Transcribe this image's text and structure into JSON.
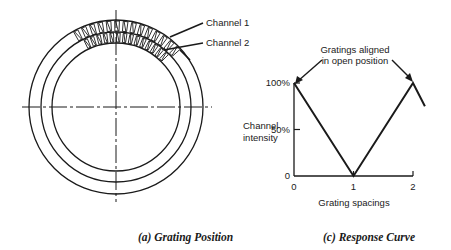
{
  "grating_diagram": {
    "labels": {
      "channel_1": "Channel 1",
      "channel_2": "Channel 2"
    },
    "caption": "(a)  Grating Position"
  },
  "response_chart": {
    "caption": "(c)  Response Curve",
    "annotation": [
      "Gratings aligned",
      "in open position"
    ]
  },
  "chart_data": {
    "type": "line",
    "title": "Response Curve",
    "xlabel": "Grating spacings",
    "ylabel": "Channel intensity",
    "ylabel_lines": [
      "Channel",
      "intensity"
    ],
    "x": [
      0,
      1,
      2,
      2.2
    ],
    "series": [
      {
        "name": "Channel intensity",
        "values": [
          100,
          0,
          100,
          75
        ]
      }
    ],
    "xticks": [
      0,
      1,
      2
    ],
    "xtick_labels": [
      "0",
      "1",
      "2"
    ],
    "yticks": [
      0,
      50,
      100
    ],
    "ytick_labels": [
      "0",
      "50%",
      "100%"
    ],
    "xlim": [
      0,
      2
    ],
    "ylim": [
      0,
      100
    ],
    "grid": false,
    "annotations": [
      {
        "text": "Gratings aligned in open position",
        "points_to": [
          [
            0,
            100
          ],
          [
            2,
            100
          ]
        ]
      }
    ]
  }
}
